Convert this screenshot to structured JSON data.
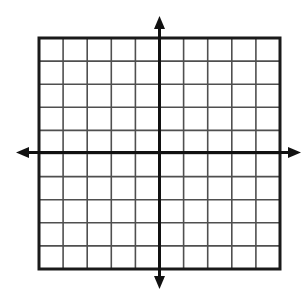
{
  "figure": {
    "title": "Blank Cartesian coordinate grid",
    "background_color": "#ffffff",
    "width": 305,
    "height": 294
  },
  "chart_data": {
    "type": "scatter",
    "title": "",
    "subtitle": "",
    "xlabel": "",
    "ylabel": "",
    "xlim": [
      -5,
      5
    ],
    "ylim": [
      -5,
      5
    ],
    "x": [],
    "y": [],
    "series": [],
    "xticks": [
      -5,
      -4,
      -3,
      -2,
      -1,
      0,
      1,
      2,
      3,
      4,
      5
    ],
    "yticks": [
      -5,
      -4,
      -3,
      -2,
      -1,
      0,
      1,
      2,
      3,
      4,
      5
    ],
    "xtick_labels": [],
    "ytick_labels": [],
    "legend": [],
    "legend_position": "none",
    "grid": true,
    "grid_columns": 10,
    "grid_rows": 10,
    "grid_cell_size_px": 24.1,
    "annotations": []
  },
  "geometry": {
    "plot_left": 39,
    "plot_top": 38,
    "plot_right": 280,
    "plot_bottom": 269,
    "x_axis_y": 152.5,
    "y_axis_x": 159.5,
    "arrow_up_tip_y": 16,
    "arrow_down_tip_y": 289,
    "arrow_left_tip_x": 16,
    "arrow_right_tip_x": 301
  },
  "colors": {
    "grid_line": "#4f4f4f",
    "axis_line": "#111111",
    "border_line": "#1a1a1a",
    "background": "#ffffff"
  },
  "strokes": {
    "grid_width": 1.6,
    "axis_width": 3.0,
    "border_width": 3.0
  },
  "labels": {
    "x_axis_name": "x-axis",
    "y_axis_name": "y-axis",
    "origin_name": "origin"
  }
}
